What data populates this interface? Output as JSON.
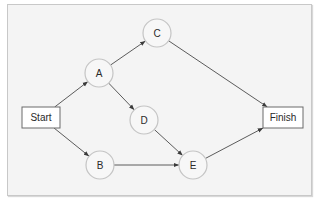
{
  "diagram": {
    "type": "network-flow",
    "nodes": [
      {
        "id": "start",
        "label": "Start",
        "shape": "rect",
        "x": 22,
        "y": 107,
        "w": 38,
        "h": 21
      },
      {
        "id": "A",
        "label": "A",
        "shape": "circle",
        "cx": 99,
        "cy": 73,
        "r": 14
      },
      {
        "id": "C",
        "label": "C",
        "shape": "circle",
        "cx": 157,
        "cy": 33,
        "r": 14
      },
      {
        "id": "D",
        "label": "D",
        "shape": "circle",
        "cx": 144,
        "cy": 120,
        "r": 14
      },
      {
        "id": "B",
        "label": "B",
        "shape": "circle",
        "cx": 100,
        "cy": 165,
        "r": 14
      },
      {
        "id": "E",
        "label": "E",
        "shape": "circle",
        "cx": 193,
        "cy": 165,
        "r": 14
      },
      {
        "id": "finish",
        "label": "Finish",
        "shape": "rect",
        "x": 263,
        "y": 107,
        "w": 40,
        "h": 21
      }
    ],
    "edges": [
      {
        "from": "start",
        "to": "A"
      },
      {
        "from": "start",
        "to": "B"
      },
      {
        "from": "A",
        "to": "C"
      },
      {
        "from": "A",
        "to": "D"
      },
      {
        "from": "C",
        "to": "finish"
      },
      {
        "from": "D",
        "to": "E"
      },
      {
        "from": "B",
        "to": "E"
      },
      {
        "from": "E",
        "to": "finish"
      }
    ]
  },
  "colors": {
    "background": "#f4f4f4",
    "circle_stroke": "#c4c4c4",
    "box_stroke": "#6a6a6a",
    "edge": "#4a4a4a"
  }
}
